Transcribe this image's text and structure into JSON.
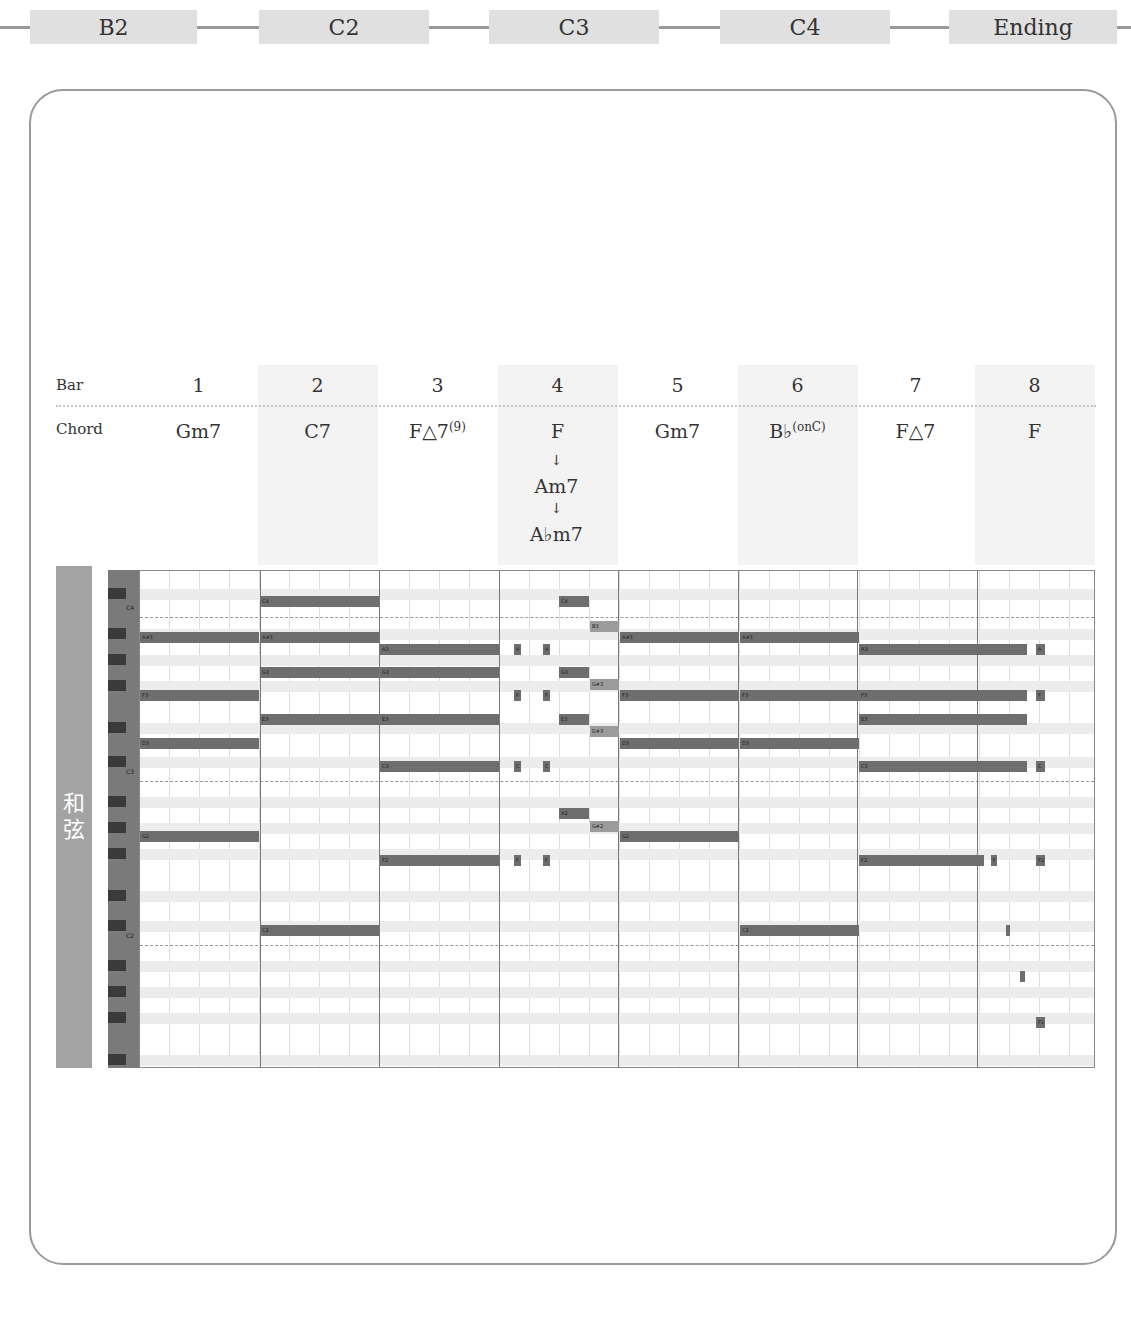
{
  "section_flow": [
    {
      "label": "B2",
      "x": 30,
      "w": 167
    },
    {
      "label": "C2",
      "x": 259,
      "w": 170
    },
    {
      "label": "C3",
      "x": 489,
      "w": 170
    },
    {
      "label": "C4",
      "x": 720,
      "w": 170
    },
    {
      "label": "Ending",
      "x": 949,
      "w": 168
    }
  ],
  "header": {
    "bar_label": "Bar",
    "chord_label": "Chord",
    "bars": [
      {
        "num": "1",
        "chord": "Gm7",
        "sup": "",
        "shaded": false
      },
      {
        "num": "2",
        "chord": "C7",
        "sup": "",
        "shaded": true
      },
      {
        "num": "3",
        "chord": "F△7",
        "sup": "(9)",
        "shaded": false
      },
      {
        "num": "4",
        "chord": "F",
        "sup": "",
        "shaded": true
      },
      {
        "num": "5",
        "chord": "Gm7",
        "sup": "",
        "shaded": false
      },
      {
        "num": "6",
        "chord": "B♭",
        "sup": "(onC)",
        "shaded": true
      },
      {
        "num": "7",
        "chord": "F△7",
        "sup": "",
        "shaded": false
      },
      {
        "num": "8",
        "chord": "F",
        "sup": "",
        "shaded": true
      }
    ],
    "bar4_sequence": [
      "F",
      "Am7",
      "A♭m7"
    ],
    "arrow": "↓"
  },
  "track": {
    "label_line1": "和",
    "label_line2": "弦"
  },
  "keyboard": {
    "octave_labels": [
      {
        "label": "C4",
        "y": 34
      },
      {
        "label": "C3",
        "y": 198
      },
      {
        "label": "C2",
        "y": 362
      }
    ],
    "black_keys_y": [
      18,
      58,
      84,
      110,
      152,
      186,
      226,
      252,
      278,
      320,
      350,
      390,
      416,
      442,
      484
    ]
  },
  "chart_data": {
    "type": "piano_roll",
    "bars": 8,
    "x_range_px": [
      139,
      1095
    ],
    "notes": [
      {
        "bar": 1,
        "label": "A#3",
        "x": 0,
        "w": 119,
        "y": 61,
        "light": false
      },
      {
        "bar": 1,
        "label": "F3",
        "x": 0,
        "w": 119,
        "y": 119,
        "light": false
      },
      {
        "bar": 1,
        "label": "D3",
        "x": 0,
        "w": 119,
        "y": 167,
        "light": false
      },
      {
        "bar": 1,
        "label": "G2",
        "x": 0,
        "w": 119,
        "y": 260,
        "light": false
      },
      {
        "bar": 2,
        "label": "C4",
        "x": 120,
        "w": 119,
        "y": 25,
        "light": false
      },
      {
        "bar": 2,
        "label": "A#3",
        "x": 120,
        "w": 119,
        "y": 61,
        "light": false
      },
      {
        "bar": 2,
        "label": "G3",
        "x": 120,
        "w": 119,
        "y": 96,
        "light": false
      },
      {
        "bar": 2,
        "label": "E3",
        "x": 120,
        "w": 119,
        "y": 143,
        "light": false
      },
      {
        "bar": 2,
        "label": "C2",
        "x": 120,
        "w": 119,
        "y": 354,
        "light": false
      },
      {
        "bar": 3,
        "label": "A3",
        "x": 240,
        "w": 119,
        "y": 73,
        "light": false
      },
      {
        "bar": 3,
        "label": "G3",
        "x": 240,
        "w": 119,
        "y": 96,
        "light": false
      },
      {
        "bar": 3,
        "label": "E3",
        "x": 240,
        "w": 119,
        "y": 143,
        "light": false
      },
      {
        "bar": 3,
        "label": "C3",
        "x": 240,
        "w": 119,
        "y": 190,
        "light": false
      },
      {
        "bar": 3,
        "label": "F2",
        "x": 240,
        "w": 119,
        "y": 284,
        "light": false
      },
      {
        "bar": 4,
        "label": "A",
        "x": 374,
        "w": 7,
        "y": 73,
        "light": false
      },
      {
        "bar": 4,
        "label": "A",
        "x": 403,
        "w": 7,
        "y": 73,
        "light": false
      },
      {
        "bar": 4,
        "label": "F",
        "x": 374,
        "w": 7,
        "y": 119,
        "light": false
      },
      {
        "bar": 4,
        "label": "F",
        "x": 403,
        "w": 7,
        "y": 119,
        "light": false
      },
      {
        "bar": 4,
        "label": "C",
        "x": 374,
        "w": 7,
        "y": 190,
        "light": false
      },
      {
        "bar": 4,
        "label": "C",
        "x": 403,
        "w": 7,
        "y": 190,
        "light": false
      },
      {
        "bar": 4,
        "label": "F",
        "x": 374,
        "w": 7,
        "y": 284,
        "light": false
      },
      {
        "bar": 4,
        "label": "F",
        "x": 403,
        "w": 7,
        "y": 284,
        "light": false
      },
      {
        "bar": 4,
        "label": "C4",
        "x": 419,
        "w": 30,
        "y": 25,
        "light": false
      },
      {
        "bar": 4,
        "label": "G3",
        "x": 419,
        "w": 30,
        "y": 96,
        "light": false
      },
      {
        "bar": 4,
        "label": "E3",
        "x": 419,
        "w": 30,
        "y": 143,
        "light": false
      },
      {
        "bar": 4,
        "label": "A2",
        "x": 419,
        "w": 30,
        "y": 237,
        "light": false
      },
      {
        "bar": 4,
        "label": "B3",
        "x": 450,
        "w": 29,
        "y": 50,
        "light": true
      },
      {
        "bar": 4,
        "label": "G#3",
        "x": 450,
        "w": 29,
        "y": 108,
        "light": true
      },
      {
        "bar": 4,
        "label": "D#3",
        "x": 450,
        "w": 29,
        "y": 155,
        "light": true
      },
      {
        "bar": 4,
        "label": "G#2",
        "x": 450,
        "w": 29,
        "y": 250,
        "light": true
      },
      {
        "bar": 5,
        "label": "A#3",
        "x": 480,
        "w": 119,
        "y": 61,
        "light": false
      },
      {
        "bar": 5,
        "label": "F3",
        "x": 480,
        "w": 119,
        "y": 119,
        "light": false
      },
      {
        "bar": 5,
        "label": "D3",
        "x": 480,
        "w": 119,
        "y": 167,
        "light": false
      },
      {
        "bar": 5,
        "label": "G2",
        "x": 480,
        "w": 119,
        "y": 260,
        "light": false
      },
      {
        "bar": 6,
        "label": "A#3",
        "x": 600,
        "w": 119,
        "y": 61,
        "light": false
      },
      {
        "bar": 6,
        "label": "F3",
        "x": 600,
        "w": 119,
        "y": 119,
        "light": false
      },
      {
        "bar": 6,
        "label": "D3",
        "x": 600,
        "w": 119,
        "y": 167,
        "light": false
      },
      {
        "bar": 6,
        "label": "C2",
        "x": 600,
        "w": 119,
        "y": 354,
        "light": false
      },
      {
        "bar": 7,
        "label": "A3",
        "x": 719,
        "w": 168,
        "y": 73,
        "light": false
      },
      {
        "bar": 7,
        "label": "F3",
        "x": 719,
        "w": 168,
        "y": 119,
        "light": false
      },
      {
        "bar": 7,
        "label": "E3",
        "x": 719,
        "w": 168,
        "y": 143,
        "light": false
      },
      {
        "bar": 7,
        "label": "C3",
        "x": 719,
        "w": 168,
        "y": 190,
        "light": false
      },
      {
        "bar": 7,
        "label": "F2",
        "x": 719,
        "w": 125,
        "y": 284,
        "light": false
      },
      {
        "bar": 7,
        "label": "F",
        "x": 851,
        "w": 6,
        "y": 284,
        "light": false
      },
      {
        "bar": 8,
        "label": "A",
        "x": 896,
        "w": 9,
        "y": 73,
        "light": false
      },
      {
        "bar": 8,
        "label": "F",
        "x": 896,
        "w": 9,
        "y": 119,
        "light": false
      },
      {
        "bar": 8,
        "label": "C",
        "x": 896,
        "w": 9,
        "y": 190,
        "light": false
      },
      {
        "bar": 8,
        "label": "F2",
        "x": 896,
        "w": 9,
        "y": 284,
        "light": false
      },
      {
        "bar": 8,
        "label": "",
        "x": 866,
        "w": 4,
        "y": 354,
        "light": false
      },
      {
        "bar": 8,
        "label": "",
        "x": 880,
        "w": 5,
        "y": 400,
        "light": false
      },
      {
        "bar": 8,
        "label": "F1",
        "x": 896,
        "w": 9,
        "y": 446,
        "light": false
      }
    ]
  }
}
